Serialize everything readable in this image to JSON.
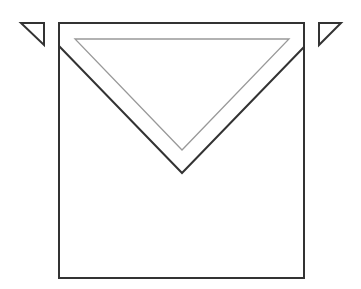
{
  "diagram": {
    "colors": {
      "stroke": "#333333",
      "inner_stroke": "#999999",
      "background": "#ffffff"
    },
    "shapes": {
      "left_small_triangle": {
        "points": "21,23 44,23 44,45"
      },
      "right_small_triangle": {
        "points": "319,23 341,23 319,45"
      },
      "square": {
        "x": 59,
        "y": 23,
        "width": 245,
        "height": 255
      },
      "v_flap": {
        "points": "59,46 182,173 304,47"
      },
      "inner_triangle": {
        "points": "75,39 289,39 182,150"
      }
    }
  }
}
